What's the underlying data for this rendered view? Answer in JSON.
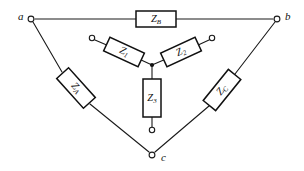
{
  "figure": {
    "background_color": "#ffffff",
    "line_color": "#1a1a1a",
    "box_fill": "#ffffff",
    "box_stroke": "#111111"
  },
  "nodes": [
    {
      "id": "a",
      "label": "a",
      "x": 31,
      "y": 19,
      "label_x": 18,
      "label_y": 17
    },
    {
      "id": "b",
      "label": "b",
      "x": 277,
      "y": 19,
      "label_x": 285,
      "label_y": 17
    },
    {
      "id": "c",
      "label": "c",
      "x": 152,
      "y": 155,
      "label_x": 161,
      "label_y": 158
    }
  ],
  "open_terminals": [
    {
      "id": "t1",
      "for": "Z1",
      "x": 92,
      "y": 38
    },
    {
      "id": "t2",
      "for": "Z2",
      "x": 212,
      "y": 38
    },
    {
      "id": "t3",
      "for": "Z3",
      "x": 152,
      "y": 130
    }
  ],
  "junction": {
    "id": "wye-center",
    "x": 152,
    "y": 65
  },
  "components": [
    {
      "id": "ZB",
      "label": "Z",
      "subscript": "B",
      "network": "delta",
      "between": [
        "a",
        "b"
      ],
      "cx": 156,
      "cy": 19,
      "width": 40,
      "height": 16,
      "rotation": 0
    },
    {
      "id": "ZA",
      "label": "Z",
      "subscript": "A",
      "network": "delta",
      "between": [
        "a",
        "c"
      ],
      "cx": 76,
      "cy": 88,
      "width": 40,
      "height": 16,
      "rotation": 48
    },
    {
      "id": "ZC",
      "label": "Z",
      "subscript": "C",
      "network": "delta",
      "between": [
        "b",
        "c"
      ],
      "cx": 222,
      "cy": 90,
      "width": 40,
      "height": 16,
      "rotation": -51
    },
    {
      "id": "Z1",
      "label": "Z",
      "subscript": "1",
      "network": "wye",
      "between": [
        "t1",
        "wye-center"
      ],
      "cx": 124,
      "cy": 52,
      "width": 38,
      "height": 15,
      "rotation": 25
    },
    {
      "id": "Z2",
      "label": "Z",
      "subscript": "2",
      "network": "wye",
      "between": [
        "t2",
        "wye-center"
      ],
      "cx": 181,
      "cy": 52,
      "width": 38,
      "height": 15,
      "rotation": -25
    },
    {
      "id": "Z3",
      "label": "Z",
      "subscript": "3",
      "network": "wye",
      "between": [
        "wye-center",
        "t3"
      ],
      "cx": 152,
      "cy": 98,
      "width": 18,
      "height": 38,
      "rotation": 0
    }
  ]
}
